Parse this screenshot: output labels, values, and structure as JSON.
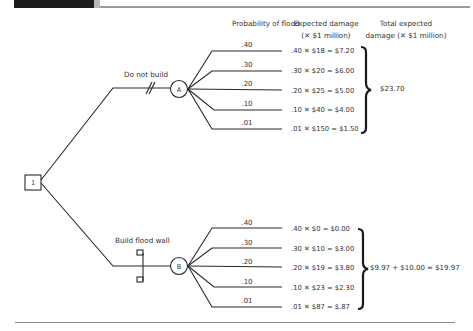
{
  "headers": {
    "probability": "Probability of flood",
    "expected_damage_line1": "Expected damage",
    "expected_damage_line2": "(✕ $1 million)",
    "total_line1": "Total expected",
    "total_line2": "damage (✕ $1 million)"
  },
  "decision_node": {
    "label": "1"
  },
  "branches": [
    {
      "name": "Do not build",
      "chance_node": "A",
      "marker": "double-hash (rejected alternative)",
      "outcomes": [
        {
          "prob": ".40",
          "calc": ".40 ✕ $18 = $7.20"
        },
        {
          "prob": ".30",
          "calc": ".30 ✕ $20 = $6.00"
        },
        {
          "prob": ".20",
          "calc": ".20 ✕ $25 = $5.00"
        },
        {
          "prob": ".10",
          "calc": ".10 ✕ $40 = $4.00"
        },
        {
          "prob": ".01",
          "calc": ".01 ✕ $150 = $1.50"
        }
      ],
      "total": "$23.70"
    },
    {
      "name": "Build flood wall",
      "chance_node": "B",
      "marker": "flood wall symbol",
      "outcomes": [
        {
          "prob": ".40",
          "calc": ".40 ✕ $0 = $0.00"
        },
        {
          "prob": ".30",
          "calc": ".30 ✕ $10 = $3.00"
        },
        {
          "prob": ".20",
          "calc": ".20 ✕ $19 = $3.80"
        },
        {
          "prob": ".10",
          "calc": ".10 ✕ $23 = $2.30"
        },
        {
          "prob": ".01",
          "calc": ".01 ✕ $87 = $.87"
        }
      ],
      "total": "$9.97 + $10.00 = $19.97"
    }
  ],
  "colors": {
    "line": "#2a2a2a",
    "text": "#333333",
    "rule": "#9a9a9a"
  }
}
